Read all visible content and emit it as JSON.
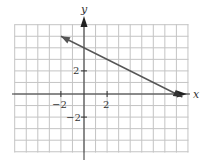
{
  "chart_data": {
    "type": "line",
    "title": "",
    "xlabel": "x",
    "ylabel": "y",
    "xlim": [
      -6,
      9
    ],
    "ylim": [
      -5,
      6
    ],
    "grid": true,
    "grid_step": 1,
    "x_tick_labels": [
      {
        "value": -2,
        "label": "−2"
      },
      {
        "value": 2,
        "label": "2"
      }
    ],
    "y_tick_labels": [
      {
        "value": 2,
        "label": "2"
      },
      {
        "value": -2,
        "label": "−2"
      }
    ],
    "series": [
      {
        "name": "line",
        "equation": "y = -1/2 x + 4",
        "x": [
          -2,
          0,
          2,
          4,
          6,
          8
        ],
        "values": [
          5,
          4,
          3,
          2,
          1,
          0
        ],
        "arrows_both_ends": true
      }
    ],
    "colors": {
      "grid": "#c4c4c4",
      "axis": "#333333",
      "line": "#555555"
    },
    "legend": null
  },
  "labels": {
    "x_axis": "x",
    "y_axis": "y",
    "x_tick_neg2": "−2",
    "x_tick_pos2": "2",
    "y_tick_pos2": "2",
    "y_tick_neg2": "−2"
  }
}
